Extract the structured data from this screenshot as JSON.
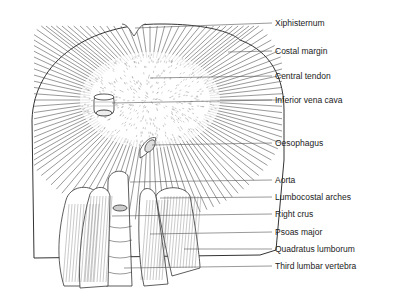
{
  "figure": {
    "labels": [
      {
        "id": "xiphisternum",
        "text": "Xiphisternum"
      },
      {
        "id": "costal-margin",
        "text": "Costal margin"
      },
      {
        "id": "central-tendon",
        "text": "Central tendon"
      },
      {
        "id": "inferior-vena-cava",
        "text": "Inferior vena cava"
      },
      {
        "id": "oesophagus",
        "text": "Oesophagus"
      },
      {
        "id": "aorta",
        "text": "Aorta"
      },
      {
        "id": "lumbocostal-arches",
        "text": "Lumbocostal arches"
      },
      {
        "id": "right-crus",
        "text": "Right crus"
      },
      {
        "id": "psoas-major",
        "text": "Psoas major"
      },
      {
        "id": "quadratus-lumborum",
        "text": "Quadratus lumborum"
      },
      {
        "id": "third-lumbar-vertebra",
        "text": "Third lumbar vertebra"
      }
    ]
  }
}
